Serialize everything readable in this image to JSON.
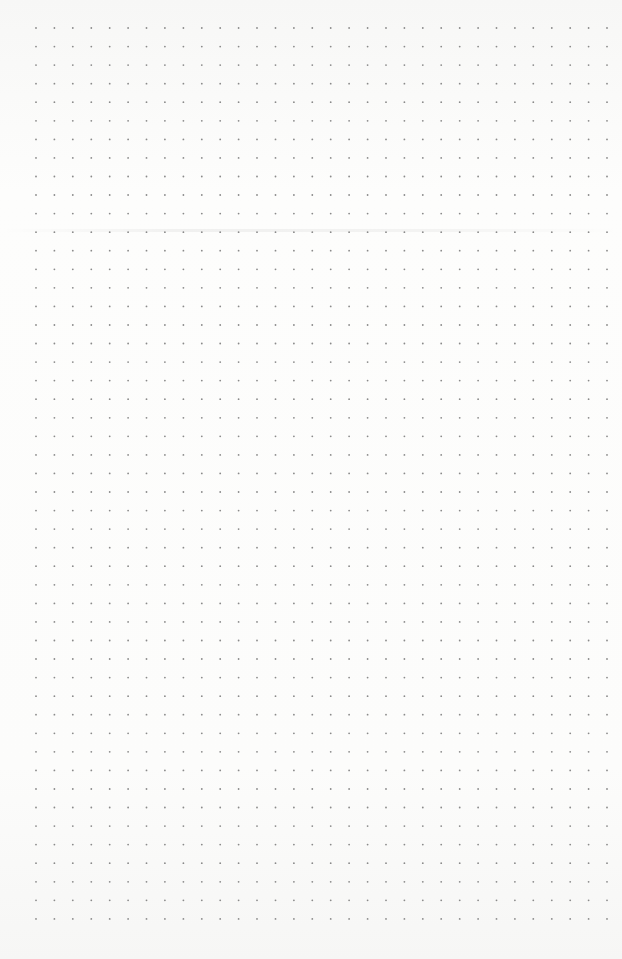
{
  "page": {
    "type": "dot-grid paper",
    "dot_color": "#8a8a8a",
    "background_color": "#fbfbfa",
    "grid": {
      "start_x": 36,
      "start_y": 28,
      "step_x": 18.42,
      "step_y": 18.56,
      "cols": 32,
      "rows": 49,
      "dot_radius": 0.9
    }
  }
}
